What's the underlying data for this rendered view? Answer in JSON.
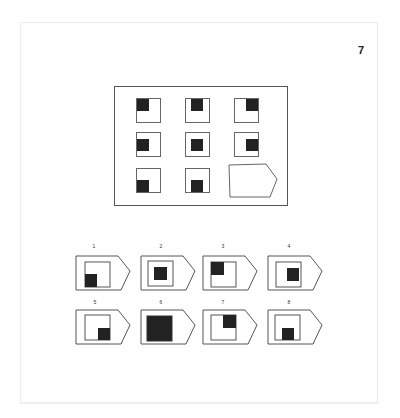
{
  "page": {
    "number": "7"
  },
  "colors": {
    "stroke": "#555555",
    "fill_dark": "#222222",
    "background": "#ffffff"
  },
  "matrix": {
    "rows": 3,
    "cols": 3,
    "cells": [
      {
        "row": 0,
        "col": 0,
        "dot_position": "top-left"
      },
      {
        "row": 0,
        "col": 1,
        "dot_position": "top-center"
      },
      {
        "row": 0,
        "col": 2,
        "dot_position": "top-right"
      },
      {
        "row": 1,
        "col": 0,
        "dot_position": "middle-left"
      },
      {
        "row": 1,
        "col": 1,
        "dot_position": "center"
      },
      {
        "row": 1,
        "col": 2,
        "dot_position": "middle-right"
      },
      {
        "row": 2,
        "col": 0,
        "dot_position": "bottom-left"
      },
      {
        "row": 2,
        "col": 1,
        "dot_position": "bottom-center"
      },
      {
        "row": 2,
        "col": 2,
        "dot_position": "missing",
        "placeholder_shape": "pentagon-arrow"
      }
    ]
  },
  "options": [
    {
      "label": "1",
      "inner_square": "offset-left",
      "dot_position": "bottom-left"
    },
    {
      "label": "2",
      "inner_square": "centered",
      "dot_position": "center"
    },
    {
      "label": "3",
      "inner_square": "offset-left",
      "dot_position": "top-left"
    },
    {
      "label": "4",
      "inner_square": "centered",
      "dot_position": "middle-right"
    },
    {
      "label": "5",
      "inner_square": "offset-left",
      "dot_position": "bottom-right"
    },
    {
      "label": "6",
      "inner_square": "filled",
      "dot_position": "full"
    },
    {
      "label": "7",
      "inner_square": "offset-left",
      "dot_position": "top-right"
    },
    {
      "label": "8",
      "inner_square": "centered",
      "dot_position": "bottom-center"
    }
  ]
}
